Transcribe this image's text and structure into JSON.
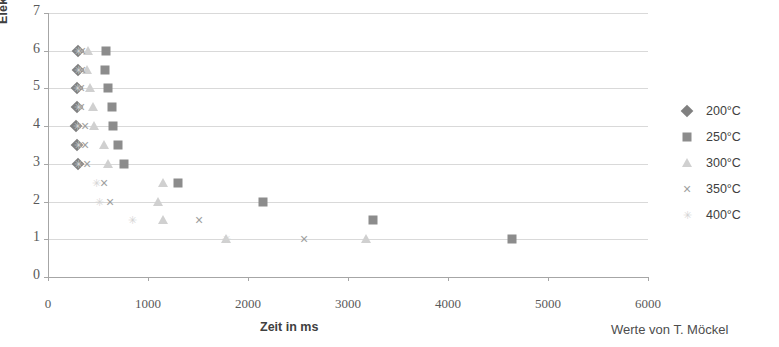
{
  "footnote": "Werte von T. Möckel",
  "legend": {
    "position": "right",
    "items": [
      {
        "label": "200°C",
        "marker": "diamond",
        "color": "#808080"
      },
      {
        "label": "250°C",
        "marker": "square",
        "color": "#8c8c8c"
      },
      {
        "label": "300°C",
        "marker": "triangle",
        "color": "#d0d0d0"
      },
      {
        "label": "350°C",
        "marker": "x",
        "color": "#9e9e9e"
      },
      {
        "label": "400°C",
        "marker": "star",
        "color": "#d4d4d4"
      }
    ]
  },
  "chart_data": {
    "type": "scatter",
    "title": "",
    "xlabel": "Zeit in ms",
    "ylabel": "Elektrodenkraft in kN",
    "xlim": [
      0,
      6000
    ],
    "ylim": [
      0,
      7
    ],
    "xticks": [
      0,
      1000,
      2000,
      3000,
      4000,
      5000,
      6000
    ],
    "yticks": [
      0,
      1,
      2,
      3,
      4,
      5,
      6,
      7
    ],
    "xtick_labels": [
      "0",
      "1000",
      "2000",
      "3000",
      "4000",
      "5000",
      "6000"
    ],
    "ytick_labels": [
      "0",
      "1",
      "2",
      "3",
      "4",
      "5",
      "6",
      "7"
    ],
    "grid": "horizontal",
    "legend_position": "right",
    "series": [
      {
        "name": "200°C",
        "marker": "diamond",
        "color": "#808080",
        "points": [
          [
            300,
            6.0
          ],
          [
            300,
            5.5
          ],
          [
            290,
            5.0
          ],
          [
            290,
            4.5
          ],
          [
            280,
            4.0
          ],
          [
            290,
            3.5
          ],
          [
            300,
            3.0
          ]
        ]
      },
      {
        "name": "250°C",
        "marker": "square",
        "color": "#8c8c8c",
        "points": [
          [
            580,
            6.0
          ],
          [
            570,
            5.5
          ],
          [
            600,
            5.0
          ],
          [
            640,
            4.5
          ],
          [
            650,
            4.0
          ],
          [
            700,
            3.5
          ],
          [
            760,
            3.0
          ],
          [
            1300,
            2.5
          ],
          [
            2150,
            2.0
          ],
          [
            3250,
            1.5
          ],
          [
            4640,
            1.0
          ]
        ]
      },
      {
        "name": "300°C",
        "marker": "triangle",
        "color": "#d0d0d0",
        "points": [
          [
            400,
            6.0
          ],
          [
            390,
            5.5
          ],
          [
            420,
            5.0
          ],
          [
            450,
            4.5
          ],
          [
            460,
            4.0
          ],
          [
            560,
            3.5
          ],
          [
            600,
            3.0
          ],
          [
            1150,
            2.5
          ],
          [
            1100,
            2.0
          ],
          [
            1150,
            1.5
          ],
          [
            1780,
            1.0
          ],
          [
            3180,
            1.0
          ]
        ]
      },
      {
        "name": "350°C",
        "marker": "x",
        "color": "#9e9e9e",
        "points": [
          [
            340,
            6.0
          ],
          [
            340,
            5.5
          ],
          [
            330,
            5.0
          ],
          [
            330,
            4.5
          ],
          [
            370,
            4.0
          ],
          [
            370,
            3.5
          ],
          [
            390,
            3.0
          ],
          [
            560,
            2.5
          ],
          [
            620,
            2.0
          ],
          [
            1510,
            1.5
          ],
          [
            2560,
            1.0
          ]
        ]
      },
      {
        "name": "400°C",
        "marker": "star",
        "color": "#d4d4d4",
        "points": [
          [
            300,
            6.0
          ],
          [
            300,
            5.5
          ],
          [
            290,
            5.0
          ],
          [
            300,
            4.5
          ],
          [
            290,
            4.0
          ],
          [
            300,
            3.5
          ],
          [
            300,
            3.0
          ],
          [
            480,
            2.5
          ],
          [
            510,
            2.0
          ],
          [
            840,
            1.5
          ],
          [
            1780,
            1.0
          ]
        ]
      }
    ]
  }
}
